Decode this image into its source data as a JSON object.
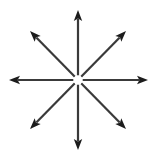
{
  "figure": {
    "type": "radial-arrow-diagram",
    "canvas": {
      "width": 157,
      "height": 158,
      "background": "#ffffff"
    },
    "style": {
      "line_color": "#3a3a3a",
      "arrowhead_color": "#1c1c1c",
      "line_width": 2.2,
      "center_gap_radius": 4.5,
      "arrowhead_length": 11,
      "arrowhead_half_width": 4.2
    },
    "center": {
      "x": 78,
      "y": 80
    },
    "arrows": [
      {
        "name": "arrow-up",
        "angle_deg": 90,
        "label": "N",
        "tip": {
          "x": 78,
          "y": 10
        },
        "length": 70
      },
      {
        "name": "arrow-up-right",
        "angle_deg": 45,
        "label": "NE",
        "tip": {
          "x": 126,
          "y": 31
        },
        "length": 69
      },
      {
        "name": "arrow-right",
        "angle_deg": 0,
        "label": "E",
        "tip": {
          "x": 148,
          "y": 80
        },
        "length": 70
      },
      {
        "name": "arrow-down-right",
        "angle_deg": -45,
        "label": "SE",
        "tip": {
          "x": 126,
          "y": 129
        },
        "length": 69
      },
      {
        "name": "arrow-down",
        "angle_deg": -90,
        "label": "S",
        "tip": {
          "x": 78,
          "y": 150
        },
        "length": 70
      },
      {
        "name": "arrow-down-left",
        "angle_deg": -135,
        "label": "SW",
        "tip": {
          "x": 30,
          "y": 129
        },
        "length": 69
      },
      {
        "name": "arrow-left",
        "angle_deg": 180,
        "label": "W",
        "tip": {
          "x": 9,
          "y": 80
        },
        "length": 70
      },
      {
        "name": "arrow-up-left",
        "angle_deg": 135,
        "label": "NW",
        "tip": {
          "x": 30,
          "y": 31
        },
        "length": 69
      }
    ]
  }
}
